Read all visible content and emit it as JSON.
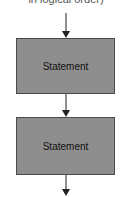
{
  "diagram": {
    "type": "flowchart",
    "caption": "in logical order)",
    "nodes": [
      {
        "id": "stmt1",
        "label": "Statement"
      },
      {
        "id": "stmt2",
        "label": "Statement"
      }
    ],
    "edges": [
      {
        "from": "entry",
        "to": "stmt1"
      },
      {
        "from": "stmt1",
        "to": "stmt2"
      },
      {
        "from": "stmt2",
        "to": "exit"
      }
    ],
    "colors": {
      "box_fill": "#8e8e8e",
      "box_border": "#4a4a4a",
      "line": "#222222"
    }
  }
}
